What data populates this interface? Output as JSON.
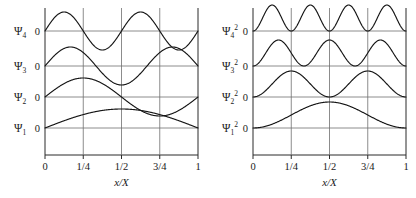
{
  "figure": {
    "background": "#ffffff",
    "ink_color": "#151515",
    "grid_color": "#6e6e6e"
  },
  "chart_data": [
    {
      "type": "line",
      "panel": "left",
      "title": "",
      "xlabel": "x/X",
      "ylabel": "",
      "xlim": [
        0,
        1
      ],
      "grid": true,
      "legend": "none",
      "x_ticks": [
        0,
        0.25,
        0.5,
        0.75,
        1
      ],
      "x_ticklabels": [
        "0",
        "1/4",
        "1/2",
        "3/4",
        "1"
      ],
      "baseline_label": "0",
      "series": [
        {
          "name": "Psi_4",
          "label_base": "Ψ",
          "label_sub": "4",
          "label_sup": "",
          "zero_label": "0",
          "harmonic": 4,
          "squared": false,
          "amplitude": 1,
          "description": "sin(4πx/X), four half-waves, two full periods, nodes at 0, 1/4, 1/2, 3/4, 1"
        },
        {
          "name": "Psi_3",
          "label_base": "Ψ",
          "label_sub": "3",
          "label_sup": "",
          "zero_label": "0",
          "harmonic": 3,
          "squared": false,
          "amplitude": 1,
          "description": "sin(3πx/X), three half-waves, nodes at 0, 1/3, 2/3, 1"
        },
        {
          "name": "Psi_2",
          "label_base": "Ψ",
          "label_sub": "2",
          "label_sup": "",
          "zero_label": "0",
          "harmonic": 2,
          "squared": false,
          "amplitude": 1,
          "description": "sin(2πx/X), two half-waves, node at 1/2"
        },
        {
          "name": "Psi_1",
          "label_base": "Ψ",
          "label_sub": "1",
          "label_sup": "",
          "zero_label": "0",
          "harmonic": 1,
          "squared": false,
          "amplitude": 1,
          "description": "sin(πx/X), single half-wave arch peaking at 1/2"
        }
      ]
    },
    {
      "type": "line",
      "panel": "right",
      "title": "",
      "xlabel": "x/X",
      "ylabel": "",
      "xlim": [
        0,
        1
      ],
      "grid": true,
      "legend": "none",
      "x_ticks": [
        0,
        0.25,
        0.5,
        0.75,
        1
      ],
      "x_ticklabels": [
        "0",
        "1/4",
        "1/2",
        "3/4",
        "1"
      ],
      "baseline_label": "0",
      "series": [
        {
          "name": "Psi_4_squared",
          "label_base": "Ψ",
          "label_sub": "4",
          "label_sup": "2",
          "zero_label": "0",
          "harmonic": 4,
          "squared": true,
          "amplitude": 1,
          "description": "sin^2(4πx/X), four positive humps, all above baseline"
        },
        {
          "name": "Psi_3_squared",
          "label_base": "Ψ",
          "label_sub": "3",
          "label_sup": "2",
          "zero_label": "0",
          "harmonic": 3,
          "squared": true,
          "amplitude": 1,
          "description": "sin^2(3πx/X), three positive humps"
        },
        {
          "name": "Psi_2_squared",
          "label_base": "Ψ",
          "label_sub": "2",
          "label_sup": "2",
          "zero_label": "0",
          "harmonic": 2,
          "squared": true,
          "amplitude": 1,
          "description": "sin^2(2πx/X), two positive humps with node at 1/2"
        },
        {
          "name": "Psi_1_squared",
          "label_base": "Ψ",
          "label_sub": "1",
          "label_sup": "2",
          "zero_label": "0",
          "harmonic": 1,
          "squared": true,
          "amplitude": 1,
          "description": "sin^2(πx/X), single broad hump peaking at 1/2"
        }
      ]
    }
  ],
  "panels": {
    "left": {
      "axis_title": "x/X",
      "tick_labels": [
        "0",
        "1/4",
        "1/2",
        "3/4",
        "1"
      ],
      "rows": [
        {
          "base": "Ψ",
          "sub": "4",
          "sup": "",
          "zero": "0"
        },
        {
          "base": "Ψ",
          "sub": "3",
          "sup": "",
          "zero": "0"
        },
        {
          "base": "Ψ",
          "sub": "2",
          "sup": "",
          "zero": "0"
        },
        {
          "base": "Ψ",
          "sub": "1",
          "sup": "",
          "zero": "0"
        }
      ]
    },
    "right": {
      "axis_title": "x/X",
      "tick_labels": [
        "0",
        "1/4",
        "1/2",
        "3/4",
        "1"
      ],
      "rows": [
        {
          "base": "Ψ",
          "sub": "4",
          "sup": "2",
          "zero": "0"
        },
        {
          "base": "Ψ",
          "sub": "3",
          "sup": "2",
          "zero": "0"
        },
        {
          "base": "Ψ",
          "sub": "2",
          "sup": "2",
          "zero": "0"
        },
        {
          "base": "Ψ",
          "sub": "1",
          "sup": "2",
          "zero": "0"
        }
      ]
    }
  }
}
